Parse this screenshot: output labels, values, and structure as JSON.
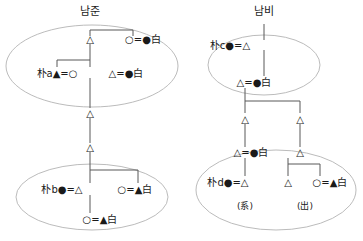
{
  "diagram": {
    "type": "kinship-genealogy-chart",
    "width": 363,
    "height": 241,
    "background_color": "#ffffff",
    "line_color": "#555555",
    "ellipse_color": "#aaaaaa",
    "text_color": "#1a1a1a",
    "legend": {
      "triangle_open": "△",
      "triangle_filled": "▲",
      "circle_open": "○",
      "circle_filled": "●",
      "marriage": "=",
      "surname_baek": "白"
    }
  },
  "titles": [
    {
      "id": "title-left",
      "label": "남준",
      "x": 90,
      "y": 6
    },
    {
      "id": "title-right",
      "label": "남비",
      "x": 264,
      "y": 6
    }
  ],
  "groups": [
    {
      "id": "group-left-top",
      "label": "namjun-upper-lineage",
      "cx": 92,
      "cy": 66,
      "rx": 86,
      "ry": 41
    },
    {
      "id": "group-left-bottom",
      "label": "namjun-lower-lineage",
      "cx": 92,
      "cy": 197,
      "rx": 76,
      "ry": 33
    },
    {
      "id": "group-right-top",
      "label": "nambi-upper-lineage",
      "cx": 264,
      "cy": 65,
      "rx": 56,
      "ry": 30
    },
    {
      "id": "group-right-bottom",
      "label": "nambi-lower-lineage",
      "cx": 276,
      "cy": 190,
      "rx": 80,
      "ry": 40
    }
  ],
  "nodes": [
    {
      "id": "ln-1",
      "label": "△",
      "x": 90,
      "y": 39,
      "align": "center"
    },
    {
      "id": "ln-2",
      "label": "○=●白",
      "x": 143,
      "y": 39,
      "align": "center"
    },
    {
      "id": "ln-3",
      "label": "朴a▲=○",
      "x": 57,
      "y": 73,
      "align": "center"
    },
    {
      "id": "ln-4",
      "label": "△=●白",
      "x": 126,
      "y": 73,
      "align": "center"
    },
    {
      "id": "ln-5",
      "label": "△",
      "x": 90,
      "y": 113,
      "align": "center"
    },
    {
      "id": "ln-6",
      "label": "△",
      "x": 90,
      "y": 147,
      "align": "center"
    },
    {
      "id": "ln-7",
      "label": "朴b●=△",
      "x": 62,
      "y": 189,
      "align": "center"
    },
    {
      "id": "ln-8",
      "label": "○=▲白",
      "x": 135,
      "y": 189,
      "align": "center"
    },
    {
      "id": "ln-9",
      "label": "○=▲白",
      "x": 100,
      "y": 219,
      "align": "center"
    },
    {
      "id": "rn-1",
      "label": "朴c●=△",
      "x": 230,
      "y": 45,
      "align": "center"
    },
    {
      "id": "rn-2",
      "label": "△=●白",
      "x": 254,
      "y": 82,
      "align": "center"
    },
    {
      "id": "rn-3",
      "label": "△",
      "x": 245,
      "y": 119,
      "align": "center"
    },
    {
      "id": "rn-4",
      "label": "△",
      "x": 300,
      "y": 119,
      "align": "center"
    },
    {
      "id": "rn-5",
      "label": "△=●白",
      "x": 251,
      "y": 152,
      "align": "center"
    },
    {
      "id": "rn-6",
      "label": "△",
      "x": 300,
      "y": 152,
      "align": "center"
    },
    {
      "id": "rn-7",
      "label": "朴d●=△",
      "x": 228,
      "y": 182,
      "align": "center"
    },
    {
      "id": "rn-8",
      "label": "△",
      "x": 288,
      "y": 182,
      "align": "center"
    },
    {
      "id": "rn-9",
      "label": "○=▲白",
      "x": 330,
      "y": 182,
      "align": "center"
    }
  ],
  "annotations": [
    {
      "id": "paren-gye",
      "label": "(系)",
      "x": 245,
      "y": 200
    },
    {
      "id": "paren-chul",
      "label": "(出)",
      "x": 305,
      "y": 200
    }
  ]
}
